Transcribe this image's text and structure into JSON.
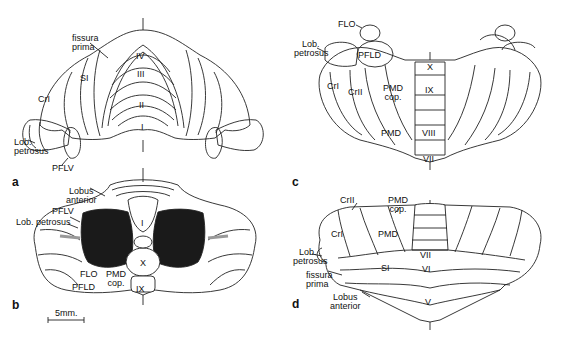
{
  "figure": {
    "panels": {
      "a": {
        "letter": "a",
        "labels": {
          "fissura_prima_1": "fissura",
          "fissura_prima_2": "prima",
          "si": "SI",
          "cr1": "CrI",
          "iv": "IV",
          "iii": "III",
          "ii": "II",
          "i": "I",
          "lob_petrosus_1": "Lob.",
          "lob_petrosus_2": "petrosus",
          "pflv": "PFLV"
        }
      },
      "b": {
        "letter": "b",
        "labels": {
          "lobus_anterior_1": "Lobus",
          "lobus_anterior_2": "anterior",
          "pflv": "PFLV",
          "lob_petrosus": "Lob. petrosus",
          "i": "I",
          "x": "X",
          "ix": "IX",
          "flo": "FLO",
          "pfld": "PFLD",
          "pmd_cop_1": "PMD",
          "pmd_cop_2": "cop."
        },
        "scale_bar": "5mm."
      },
      "c": {
        "letter": "c",
        "labels": {
          "flo": "FLO",
          "lob_petrosus_1": "Lob.",
          "lob_petrosus_2": "petrosus",
          "pfld": "PFLD",
          "cr1": "CrI",
          "cr2": "CrII",
          "pmd_cop_1": "PMD",
          "pmd_cop_2": "cop.",
          "x": "X",
          "ix": "IX",
          "pmd": "PMD",
          "viii": "VIII",
          "vii": "VII"
        }
      },
      "d": {
        "letter": "d",
        "labels": {
          "cr2": "CrII",
          "pmd_cop_1": "PMD",
          "pmd_cop_2": "cop.",
          "cr1": "CrI",
          "pmd": "PMD",
          "lob_petrosus_1": "Lob.",
          "lob_petrosus_2": "petrosus",
          "vii": "VII",
          "si": "SI",
          "vi": "VI",
          "fissura_prima_1": "fissura",
          "fissura_prima_2": "prima",
          "lobus_anterior_1": "Lobus",
          "lobus_anterior_2": "anterior",
          "v": "V"
        }
      }
    }
  }
}
